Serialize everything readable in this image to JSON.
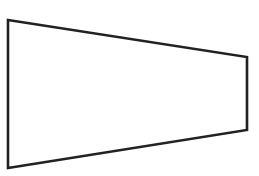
{
  "diagram": {
    "type": "trapezoid",
    "width": 259,
    "height": 176,
    "background": "#ffffff",
    "stroke": "#222222",
    "stroke_width": 2.6,
    "fill": "#ffffff",
    "vertices": [
      {
        "name": "top-left",
        "x": 8,
        "y": 20
      },
      {
        "name": "top-right",
        "x": 247,
        "y": 57
      },
      {
        "name": "bottom-right",
        "x": 247,
        "y": 130
      },
      {
        "name": "bottom-left",
        "x": 8,
        "y": 168
      }
    ]
  }
}
